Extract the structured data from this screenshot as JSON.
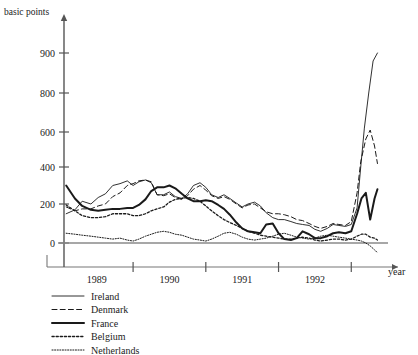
{
  "chart_data": {
    "type": "line",
    "title": "",
    "ylabel": "basic points",
    "xlabel": "year",
    "grid": false,
    "legend_position": "bottom-left",
    "y_ticks": [
      0,
      200,
      400,
      600,
      800,
      900
    ],
    "y_tick_labels": [
      "0",
      "200",
      "400",
      "600",
      "800",
      "900"
    ],
    "ylim": [
      -60,
      960
    ],
    "x_tick_positions": [
      1989.5,
      1990.5,
      1991.5,
      1992.5
    ],
    "x_tick_labels_positions": [
      1989.0,
      1990.0,
      1991.0,
      1992.0
    ],
    "x_tick_labels": [
      "1989",
      "1990",
      "1991",
      "1992"
    ],
    "xlim": [
      1988.55,
      1992.95
    ],
    "note": "Interest rate differentials in basic points; axis upper region 400-900 is vertically compressed as drawn",
    "series": [
      {
        "name": "Ireland",
        "style": "thin-solid",
        "x": [
          1988.58,
          1988.7,
          1988.8,
          1988.92,
          1989.02,
          1989.12,
          1989.22,
          1989.32,
          1989.42,
          1989.5,
          1989.58,
          1989.67,
          1989.75,
          1989.83,
          1989.92,
          1990.0,
          1990.08,
          1990.17,
          1990.25,
          1990.33,
          1990.42,
          1990.5,
          1990.58,
          1990.67,
          1990.75,
          1990.83,
          1990.92,
          1991.0,
          1991.08,
          1991.17,
          1991.25,
          1991.33,
          1991.42,
          1991.5,
          1991.58,
          1991.67,
          1991.75,
          1991.83,
          1991.92,
          1992.0,
          1992.08,
          1992.17,
          1992.25,
          1992.33,
          1992.42,
          1992.5,
          1992.58,
          1992.63,
          1992.68,
          1992.74,
          1992.8,
          1992.86
        ],
        "y": [
          150,
          170,
          215,
          200,
          235,
          255,
          300,
          310,
          325,
          300,
          320,
          330,
          315,
          250,
          250,
          265,
          240,
          230,
          255,
          300,
          315,
          290,
          250,
          235,
          250,
          230,
          205,
          185,
          200,
          210,
          190,
          155,
          130,
          120,
          120,
          110,
          100,
          95,
          90,
          70,
          60,
          75,
          95,
          90,
          85,
          95,
          180,
          400,
          620,
          800,
          880,
          900
        ]
      },
      {
        "name": "Denmark",
        "style": "dashed",
        "x": [
          1988.58,
          1988.7,
          1988.8,
          1988.92,
          1989.02,
          1989.12,
          1989.22,
          1989.32,
          1989.42,
          1989.5,
          1989.58,
          1989.67,
          1989.75,
          1989.83,
          1989.92,
          1990.0,
          1990.08,
          1990.17,
          1990.25,
          1990.33,
          1990.42,
          1990.5,
          1990.58,
          1990.67,
          1990.75,
          1990.83,
          1990.92,
          1991.0,
          1991.08,
          1991.17,
          1991.25,
          1991.33,
          1991.42,
          1991.5,
          1991.58,
          1991.67,
          1991.75,
          1991.83,
          1991.92,
          1992.0,
          1992.08,
          1992.17,
          1992.25,
          1992.33,
          1992.42,
          1992.5,
          1992.58,
          1992.63,
          1992.7,
          1992.76,
          1992.82,
          1992.86
        ],
        "y": [
          185,
          165,
          175,
          175,
          190,
          200,
          240,
          260,
          300,
          310,
          325,
          330,
          320,
          250,
          245,
          255,
          235,
          225,
          245,
          280,
          300,
          275,
          245,
          230,
          240,
          225,
          200,
          180,
          195,
          200,
          180,
          160,
          150,
          150,
          145,
          135,
          120,
          115,
          100,
          85,
          75,
          85,
          100,
          95,
          90,
          110,
          260,
          430,
          560,
          610,
          520,
          420
        ]
      },
      {
        "name": "France",
        "style": "thick-solid",
        "x": [
          1988.58,
          1988.7,
          1988.8,
          1988.92,
          1989.02,
          1989.12,
          1989.22,
          1989.32,
          1989.42,
          1989.5,
          1989.58,
          1989.67,
          1989.75,
          1989.83,
          1989.92,
          1990.0,
          1990.08,
          1990.17,
          1990.25,
          1990.33,
          1990.42,
          1990.5,
          1990.58,
          1990.67,
          1990.75,
          1990.83,
          1990.92,
          1991.0,
          1991.08,
          1991.17,
          1991.25,
          1991.33,
          1991.42,
          1991.5,
          1991.58,
          1991.67,
          1991.75,
          1991.83,
          1991.92,
          1992.0,
          1992.08,
          1992.17,
          1992.25,
          1992.33,
          1992.42,
          1992.5,
          1992.58,
          1992.64,
          1992.7,
          1992.76,
          1992.82,
          1992.86
        ],
        "y": [
          300,
          230,
          190,
          170,
          165,
          170,
          175,
          175,
          180,
          180,
          195,
          225,
          270,
          290,
          290,
          300,
          285,
          255,
          230,
          215,
          215,
          220,
          215,
          195,
          175,
          145,
          105,
          75,
          60,
          55,
          50,
          95,
          100,
          50,
          20,
          15,
          25,
          60,
          45,
          25,
          25,
          35,
          50,
          55,
          50,
          60,
          150,
          230,
          260,
          120,
          230,
          280
        ]
      },
      {
        "name": "Belgium",
        "style": "dotted-medium",
        "x": [
          1988.58,
          1988.7,
          1988.8,
          1988.92,
          1989.02,
          1989.12,
          1989.22,
          1989.32,
          1989.42,
          1989.5,
          1989.58,
          1989.67,
          1989.75,
          1989.83,
          1989.92,
          1990.0,
          1990.08,
          1990.17,
          1990.25,
          1990.33,
          1990.42,
          1990.5,
          1990.58,
          1990.67,
          1990.75,
          1990.83,
          1990.92,
          1991.0,
          1991.08,
          1991.17,
          1991.25,
          1991.33,
          1991.42,
          1991.5,
          1991.58,
          1991.67,
          1991.75,
          1991.83,
          1991.92,
          1992.0,
          1992.08,
          1992.17,
          1992.25,
          1992.33,
          1992.42,
          1992.5,
          1992.58,
          1992.64,
          1992.7,
          1992.76,
          1992.82,
          1992.86
        ],
        "y": [
          195,
          165,
          140,
          130,
          130,
          135,
          150,
          150,
          150,
          140,
          140,
          150,
          165,
          175,
          185,
          210,
          225,
          230,
          235,
          230,
          215,
          190,
          165,
          140,
          120,
          105,
          90,
          75,
          60,
          50,
          40,
          35,
          30,
          25,
          20,
          20,
          25,
          30,
          25,
          15,
          10,
          15,
          20,
          20,
          15,
          20,
          35,
          45,
          45,
          30,
          25,
          15
        ]
      },
      {
        "name": "Netherlands",
        "style": "dotted-fine",
        "x": [
          1988.58,
          1988.7,
          1988.8,
          1988.92,
          1989.02,
          1989.12,
          1989.22,
          1989.32,
          1989.42,
          1989.5,
          1989.58,
          1989.67,
          1989.75,
          1989.83,
          1989.92,
          1990.0,
          1990.08,
          1990.17,
          1990.25,
          1990.33,
          1990.42,
          1990.5,
          1990.58,
          1990.67,
          1990.75,
          1990.83,
          1990.92,
          1991.0,
          1991.08,
          1991.17,
          1991.25,
          1991.33,
          1991.42,
          1991.5,
          1991.58,
          1991.67,
          1991.75,
          1991.83,
          1991.92,
          1992.0,
          1992.08,
          1992.17,
          1992.25,
          1992.33,
          1992.42,
          1992.5,
          1992.58,
          1992.64,
          1992.7,
          1992.76,
          1992.82,
          1992.86
        ],
        "y": [
          50,
          45,
          40,
          35,
          30,
          25,
          20,
          25,
          15,
          10,
          20,
          35,
          45,
          55,
          60,
          55,
          45,
          40,
          30,
          20,
          15,
          10,
          20,
          35,
          50,
          55,
          45,
          30,
          20,
          15,
          20,
          25,
          35,
          45,
          50,
          40,
          30,
          25,
          20,
          25,
          35,
          40,
          35,
          30,
          25,
          20,
          15,
          10,
          0,
          -15,
          -35,
          -50
        ]
      }
    ]
  },
  "legend": {
    "entries": [
      {
        "label": "Ireland",
        "style": "thin-solid"
      },
      {
        "label": "Denmark",
        "style": "dashed"
      },
      {
        "label": "France",
        "style": "thick-solid"
      },
      {
        "label": "Belgium",
        "style": "dotted-medium"
      },
      {
        "label": "Netherlands",
        "style": "dotted-fine"
      }
    ]
  },
  "colors": {
    "ink": "#1a1a1a",
    "axis": "#555555",
    "frame": "#777777",
    "background": "#ffffff"
  }
}
